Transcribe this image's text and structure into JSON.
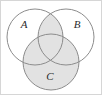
{
  "figure": {
    "kind": "venn-diagram",
    "width": 102,
    "height": 95,
    "background_color": "#ffffff",
    "border_color": "#d6d6d6"
  },
  "diagram": {
    "circle_stroke_color": "#8c8c8c",
    "circle_stroke_width": 1,
    "shade_color": "#e2e2e2",
    "unshaded_color": "#ffffff",
    "label_color": "#2b2b2b",
    "sets": [
      {
        "id": "A",
        "label": "A",
        "cx": 35,
        "cy": 37,
        "r": 28,
        "label_x": 24,
        "label_y": 25,
        "filled": false
      },
      {
        "id": "B",
        "label": "B",
        "cx": 66,
        "cy": 37,
        "r": 28,
        "label_x": 77,
        "label_y": 25,
        "filled": false
      },
      {
        "id": "C",
        "label": "C",
        "cx": 51,
        "cy": 62,
        "r": 28,
        "label_x": 50,
        "label_y": 77,
        "filled": true
      }
    ],
    "shaded_regions": [
      {
        "id": "A-and-B",
        "description": "A intersect B"
      },
      {
        "id": "C",
        "description": "C"
      }
    ]
  }
}
